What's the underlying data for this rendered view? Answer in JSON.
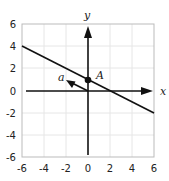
{
  "diagram": {
    "type": "coordinate-plane",
    "x_axis_label": "x",
    "y_axis_label": "y",
    "x_range": [
      -6,
      6
    ],
    "y_range": [
      -6,
      6
    ],
    "grid_step": 2,
    "x_ticks": [
      "-6",
      "-4",
      "-2",
      "0",
      "2",
      "4",
      "6"
    ],
    "y_ticks": [
      "6",
      "4",
      "2",
      "0",
      "-2",
      "-4",
      "-6"
    ],
    "line": {
      "through": [
        0,
        1
      ],
      "slope": -0.5,
      "from": [
        -6,
        4
      ],
      "to": [
        6,
        -2
      ]
    },
    "point": {
      "label": "A",
      "coords": [
        0,
        1
      ]
    },
    "vector": {
      "label": "a",
      "from": [
        0,
        0
      ],
      "to": [
        -2,
        1
      ]
    },
    "colors": {
      "ink": "#111111",
      "grid": "#e6e6e6",
      "frame": "#bbbbbb"
    }
  }
}
